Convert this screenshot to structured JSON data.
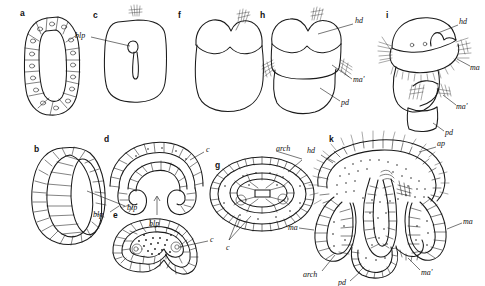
{
  "figure": {
    "background_color": "#ffffff",
    "ink_color": "#1b1b1b",
    "panels": [
      {
        "id": "a",
        "letter": "a",
        "description": "blastula in section, ring of columnar cells around central blastocoel",
        "labels": []
      },
      {
        "id": "b",
        "letter": "b",
        "description": "gastrula external view, slit-like blastopore",
        "labels": [
          {
            "text": "blp",
            "meaning": "blastopore"
          }
        ]
      },
      {
        "id": "c",
        "letter": "c",
        "description": "embryo surface view with blastopore and apical setae tuft",
        "labels": [
          {
            "text": "blp",
            "meaning": "blastopore"
          }
        ]
      },
      {
        "id": "d",
        "letter": "d",
        "description": "transverse section, invaginating archenteron, paired coelomic pouches",
        "labels": [
          {
            "text": "blp",
            "meaning": "blastopore"
          },
          {
            "text": "blp",
            "meaning": "blastopore"
          },
          {
            "text": "c",
            "meaning": "coelom"
          }
        ]
      },
      {
        "id": "e",
        "letter": "e",
        "description": "later section, closed archenteron with yolk granules, coelomic sacs",
        "labels": [
          {
            "text": "c",
            "meaning": "coelom"
          }
        ]
      },
      {
        "id": "f",
        "letter": "f",
        "description": "external view of bilobed embryo with setal tuft",
        "labels": []
      },
      {
        "id": "g",
        "letter": "g",
        "description": "oval section with central archenteron and lateral coeloms",
        "labels": [
          {
            "text": "arch",
            "meaning": "archenteron"
          },
          {
            "text": "c",
            "meaning": "coelom"
          }
        ]
      },
      {
        "id": "h",
        "letter": "h",
        "description": "three-segment larva, head and setae bundles",
        "labels": [
          {
            "text": "hd",
            "meaning": "head"
          },
          {
            "text": "ma'",
            "meaning": "mesosome / anterior trunk"
          },
          {
            "text": "pd",
            "meaning": "pedicle"
          }
        ]
      },
      {
        "id": "i",
        "letter": "i",
        "description": "lateral view of larva with ciliated mantle lobe and setae",
        "labels": [
          {
            "text": "hd",
            "meaning": "head"
          },
          {
            "text": "ma",
            "meaning": "mantle"
          },
          {
            "text": "ma'",
            "meaning": "mantle fold"
          },
          {
            "text": "pd",
            "meaning": "pedicle"
          }
        ]
      },
      {
        "id": "k",
        "letter": "k",
        "description": "detailed sagittal section of advanced larva showing apical plate, mantle lobes, archenteron and pedicle",
        "labels": [
          {
            "text": "hd",
            "meaning": "head"
          },
          {
            "text": "ap",
            "meaning": "apical plate"
          },
          {
            "text": "ma",
            "meaning": "mantle"
          },
          {
            "text": "ma'",
            "meaning": "mantle fold"
          },
          {
            "text": "arch",
            "meaning": "archenteron"
          },
          {
            "text": "pd",
            "meaning": "pedicle"
          }
        ]
      }
    ],
    "label_glossary": {
      "blp": "blastopore",
      "arch": "archenteron",
      "c": "coelom",
      "hd": "head",
      "ma": "mantle",
      "ma_prime": "ma'",
      "pd": "pedicle",
      "ap": "apical plate"
    }
  }
}
